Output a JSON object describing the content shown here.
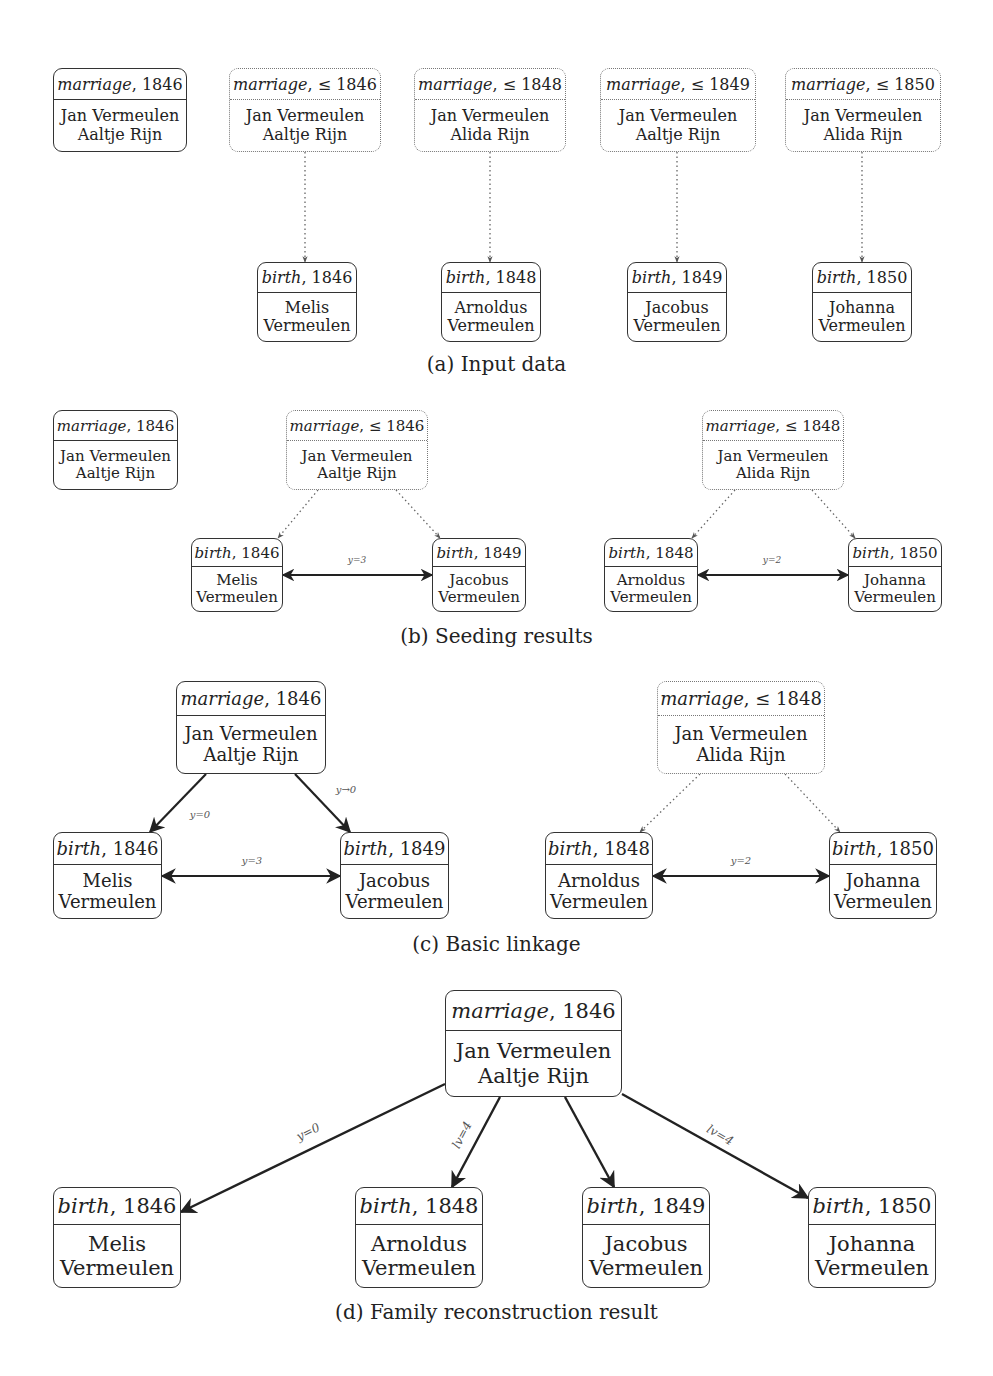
{
  "figure": {
    "panels": [
      {
        "id": "a",
        "caption": "(a) Input data",
        "caption_y": 352,
        "font": 16,
        "nodes": [
          {
            "id": "a_m0",
            "type": "marriage",
            "kind": "marriage",
            "date": ", 1846",
            "lines": [
              "Jan Vermeulen",
              "Aaltje Rijn"
            ],
            "style": "solid",
            "x": 53,
            "y": 68,
            "w": 134,
            "h": 84
          },
          {
            "id": "a_m1",
            "type": "marriage",
            "kind": "marriage",
            "date": ", ≤ 1846",
            "lines": [
              "Jan Vermeulen",
              "Aaltje Rijn"
            ],
            "style": "dotted",
            "x": 229,
            "y": 68,
            "w": 152,
            "h": 84
          },
          {
            "id": "a_m2",
            "type": "marriage",
            "kind": "marriage",
            "date": ", ≤ 1848",
            "lines": [
              "Jan Vermeulen",
              "Alida Rijn"
            ],
            "style": "dotted",
            "x": 414,
            "y": 68,
            "w": 152,
            "h": 84
          },
          {
            "id": "a_m3",
            "type": "marriage",
            "kind": "marriage",
            "date": ", ≤ 1849",
            "lines": [
              "Jan Vermeulen",
              "Aaltje Rijn"
            ],
            "style": "dotted",
            "x": 600,
            "y": 68,
            "w": 156,
            "h": 84
          },
          {
            "id": "a_m4",
            "type": "marriage",
            "kind": "marriage",
            "date": ", ≤ 1850",
            "lines": [
              "Jan Vermeulen",
              "Alida Rijn"
            ],
            "style": "dotted",
            "x": 785,
            "y": 68,
            "w": 156,
            "h": 84
          },
          {
            "id": "a_b0",
            "type": "birth",
            "kind": "birth",
            "date": ", 1846",
            "lines": [
              "Melis",
              "Vermeulen"
            ],
            "style": "solid",
            "x": 257,
            "y": 262,
            "w": 100,
            "h": 80
          },
          {
            "id": "a_b1",
            "type": "birth",
            "kind": "birth",
            "date": ", 1848",
            "lines": [
              "Arnoldus",
              "Vermeulen"
            ],
            "style": "solid",
            "x": 441,
            "y": 262,
            "w": 100,
            "h": 80
          },
          {
            "id": "a_b2",
            "type": "birth",
            "kind": "birth",
            "date": ", 1849",
            "lines": [
              "Jacobus",
              "Vermeulen"
            ],
            "style": "solid",
            "x": 627,
            "y": 262,
            "w": 100,
            "h": 80
          },
          {
            "id": "a_b3",
            "type": "birth",
            "kind": "birth",
            "date": ", 1850",
            "lines": [
              "Johanna",
              "Vermeulen"
            ],
            "style": "solid",
            "x": 812,
            "y": 262,
            "w": 100,
            "h": 80
          }
        ],
        "edges": [
          {
            "from": [
              305,
              152
            ],
            "to": [
              305,
              262
            ],
            "style": "dotted",
            "arrow": "end"
          },
          {
            "from": [
              490,
              152
            ],
            "to": [
              490,
              262
            ],
            "style": "dotted",
            "arrow": "end"
          },
          {
            "from": [
              677,
              152
            ],
            "to": [
              677,
              262
            ],
            "style": "dotted",
            "arrow": "end"
          },
          {
            "from": [
              862,
              152
            ],
            "to": [
              862,
              262
            ],
            "style": "dotted",
            "arrow": "end"
          }
        ],
        "edge_labels": []
      },
      {
        "id": "b",
        "caption": "(b) Seeding results",
        "caption_y": 624,
        "font": 15,
        "nodes": [
          {
            "id": "b_m0",
            "type": "marriage",
            "kind": "marriage",
            "date": ", 1846",
            "lines": [
              "Jan Vermeulen",
              "Aaltje Rijn"
            ],
            "style": "solid",
            "x": 53,
            "y": 410,
            "w": 125,
            "h": 80
          },
          {
            "id": "b_m1",
            "type": "marriage",
            "kind": "marriage",
            "date": ", ≤ 1846",
            "lines": [
              "Jan Vermeulen",
              "Aaltje Rijn"
            ],
            "style": "dotted",
            "x": 286,
            "y": 410,
            "w": 142,
            "h": 80
          },
          {
            "id": "b_m2",
            "type": "marriage",
            "kind": "marriage",
            "date": ", ≤ 1848",
            "lines": [
              "Jan Vermeulen",
              "Alida Rijn"
            ],
            "style": "dotted",
            "x": 702,
            "y": 410,
            "w": 142,
            "h": 80
          },
          {
            "id": "b_b0",
            "type": "birth",
            "kind": "birth",
            "date": ", 1846",
            "lines": [
              "Melis",
              "Vermeulen"
            ],
            "style": "solid",
            "x": 191,
            "y": 538,
            "w": 92,
            "h": 74
          },
          {
            "id": "b_b1",
            "type": "birth",
            "kind": "birth",
            "date": ", 1849",
            "lines": [
              "Jacobus",
              "Vermeulen"
            ],
            "style": "solid",
            "x": 432,
            "y": 538,
            "w": 94,
            "h": 74
          },
          {
            "id": "b_b2",
            "type": "birth",
            "kind": "birth",
            "date": ", 1848",
            "lines": [
              "Arnoldus",
              "Vermeulen"
            ],
            "style": "solid",
            "x": 604,
            "y": 538,
            "w": 94,
            "h": 74
          },
          {
            "id": "b_b3",
            "type": "birth",
            "kind": "birth",
            "date": ", 1850",
            "lines": [
              "Johanna",
              "Vermeulen"
            ],
            "style": "solid",
            "x": 848,
            "y": 538,
            "w": 94,
            "h": 74
          }
        ],
        "edges": [
          {
            "from": [
              318,
              490
            ],
            "to": [
              278,
              538
            ],
            "style": "dotted",
            "arrow": "end"
          },
          {
            "from": [
              396,
              490
            ],
            "to": [
              440,
              538
            ],
            "style": "dotted",
            "arrow": "end"
          },
          {
            "from": [
              735,
              490
            ],
            "to": [
              692,
              538
            ],
            "style": "dotted",
            "arrow": "end"
          },
          {
            "from": [
              812,
              490
            ],
            "to": [
              855,
              538
            ],
            "style": "dotted",
            "arrow": "end"
          },
          {
            "from": [
              283,
              575
            ],
            "to": [
              432,
              575
            ],
            "style": "solid",
            "arrow": "both"
          },
          {
            "from": [
              698,
              575
            ],
            "to": [
              848,
              575
            ],
            "style": "solid",
            "arrow": "both"
          }
        ],
        "edge_labels": [
          {
            "text": "y=3",
            "x": 357,
            "y": 560,
            "size": 9,
            "rotate": 0
          },
          {
            "text": "y=2",
            "x": 772,
            "y": 560,
            "size": 9,
            "rotate": 0
          }
        ]
      },
      {
        "id": "c",
        "caption": "(c) Basic linkage",
        "caption_y": 932,
        "font": 18,
        "nodes": [
          {
            "id": "c_m0",
            "type": "marriage",
            "kind": "marriage",
            "date": ", 1846",
            "lines": [
              "Jan Vermeulen",
              "Aaltje Rijn"
            ],
            "style": "solid",
            "x": 176,
            "y": 681,
            "w": 150,
            "h": 93
          },
          {
            "id": "c_m1",
            "type": "marriage",
            "kind": "marriage",
            "date": ", ≤ 1848",
            "lines": [
              "Jan Vermeulen",
              "Alida Rijn"
            ],
            "style": "dotted",
            "x": 657,
            "y": 681,
            "w": 168,
            "h": 93
          },
          {
            "id": "c_b0",
            "type": "birth",
            "kind": "birth",
            "date": ", 1846",
            "lines": [
              "Melis",
              "Vermeulen"
            ],
            "style": "solid",
            "x": 53,
            "y": 832,
            "w": 109,
            "h": 87
          },
          {
            "id": "c_b1",
            "type": "birth",
            "kind": "birth",
            "date": ", 1849",
            "lines": [
              "Jacobus",
              "Vermeulen"
            ],
            "style": "solid",
            "x": 340,
            "y": 832,
            "w": 109,
            "h": 87
          },
          {
            "id": "c_b2",
            "type": "birth",
            "kind": "birth",
            "date": ", 1848",
            "lines": [
              "Arnoldus",
              "Vermeulen"
            ],
            "style": "solid",
            "x": 545,
            "y": 832,
            "w": 108,
            "h": 87
          },
          {
            "id": "c_b3",
            "type": "birth",
            "kind": "birth",
            "date": ", 1850",
            "lines": [
              "Johanna",
              "Vermeulen"
            ],
            "style": "solid",
            "x": 829,
            "y": 832,
            "w": 108,
            "h": 87
          }
        ],
        "edges": [
          {
            "from": [
              206,
              774
            ],
            "to": [
              150,
              832
            ],
            "style": "solid",
            "arrow": "end",
            "width": 2.2
          },
          {
            "from": [
              295,
              774
            ],
            "to": [
              350,
              832
            ],
            "style": "solid",
            "arrow": "end",
            "width": 2.2
          },
          {
            "from": [
              700,
              774
            ],
            "to": [
              640,
              832
            ],
            "style": "dotted",
            "arrow": "end"
          },
          {
            "from": [
              785,
              774
            ],
            "to": [
              840,
              832
            ],
            "style": "dotted",
            "arrow": "end"
          },
          {
            "from": [
              162,
              876
            ],
            "to": [
              340,
              876
            ],
            "style": "solid",
            "arrow": "both",
            "width": 2.2
          },
          {
            "from": [
              653,
              876
            ],
            "to": [
              829,
              876
            ],
            "style": "solid",
            "arrow": "both",
            "width": 2.2
          }
        ],
        "edge_labels": [
          {
            "text": "y=0",
            "x": 200,
            "y": 814,
            "size": 10,
            "rotate": 0
          },
          {
            "text": "y→0",
            "x": 346,
            "y": 789,
            "size": 10,
            "rotate": 0
          },
          {
            "text": "y=3",
            "x": 252,
            "y": 860,
            "size": 10,
            "rotate": 0
          },
          {
            "text": "y=2",
            "x": 741,
            "y": 860,
            "size": 10,
            "rotate": 0
          }
        ]
      },
      {
        "id": "d",
        "caption": "(d) Family reconstruction result",
        "caption_y": 1300,
        "font": 21,
        "nodes": [
          {
            "id": "d_m0",
            "type": "marriage",
            "kind": "marriage",
            "date": ", 1846",
            "lines": [
              "Jan Vermeulen",
              "Aaltje Rijn"
            ],
            "style": "solid",
            "x": 445,
            "y": 990,
            "w": 177,
            "h": 107
          },
          {
            "id": "d_b0",
            "type": "birth",
            "kind": "birth",
            "date": ", 1846",
            "lines": [
              "Melis",
              "Vermeulen"
            ],
            "style": "solid",
            "x": 53,
            "y": 1187,
            "w": 128,
            "h": 101
          },
          {
            "id": "d_b1",
            "type": "birth",
            "kind": "birth",
            "date": ", 1848",
            "lines": [
              "Arnoldus",
              "Vermeulen"
            ],
            "style": "solid",
            "x": 355,
            "y": 1187,
            "w": 128,
            "h": 101
          },
          {
            "id": "d_b2",
            "type": "birth",
            "kind": "birth",
            "date": ", 1849",
            "lines": [
              "Jacobus",
              "Vermeulen"
            ],
            "style": "solid",
            "x": 582,
            "y": 1187,
            "w": 128,
            "h": 101
          },
          {
            "id": "d_b3",
            "type": "birth",
            "kind": "birth",
            "date": ", 1850",
            "lines": [
              "Johanna",
              "Vermeulen"
            ],
            "style": "solid",
            "x": 808,
            "y": 1187,
            "w": 128,
            "h": 101
          }
        ],
        "edges": [
          {
            "from": [
              445,
              1084
            ],
            "to": [
              181,
              1212
            ],
            "style": "solid",
            "arrow": "end",
            "width": 2.4
          },
          {
            "from": [
              500,
              1097
            ],
            "to": [
              452,
              1187
            ],
            "style": "solid",
            "arrow": "end",
            "width": 2.4
          },
          {
            "from": [
              565,
              1097
            ],
            "to": [
              614,
              1187
            ],
            "style": "solid",
            "arrow": "end",
            "width": 2.4
          },
          {
            "from": [
              622,
              1094
            ],
            "to": [
              808,
              1198
            ],
            "style": "solid",
            "arrow": "end",
            "width": 2.4
          }
        ],
        "edge_labels": [
          {
            "text": "y=0",
            "x": 308,
            "y": 1132,
            "size": 12,
            "rotate": -27
          },
          {
            "text": "lv=4",
            "x": 462,
            "y": 1135,
            "size": 12,
            "rotate": -62
          },
          {
            "text": "lv=4",
            "x": 720,
            "y": 1135,
            "size": 12,
            "rotate": 30
          }
        ]
      }
    ]
  }
}
